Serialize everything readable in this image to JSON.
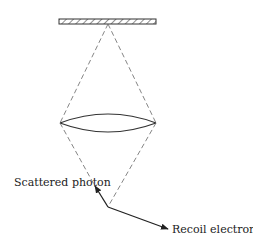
{
  "diagram": {
    "type": "compton-scattering-ray-diagram",
    "colors": {
      "stroke": "#333333",
      "dashed": "#666666",
      "text": "#222222"
    },
    "elements": {
      "plate": {
        "name": "hatched-plate"
      },
      "lens": {
        "name": "lens"
      },
      "scattered_photon": {
        "label": "Scattered photon"
      },
      "recoil_electron": {
        "label": "Recoil electron"
      }
    }
  }
}
